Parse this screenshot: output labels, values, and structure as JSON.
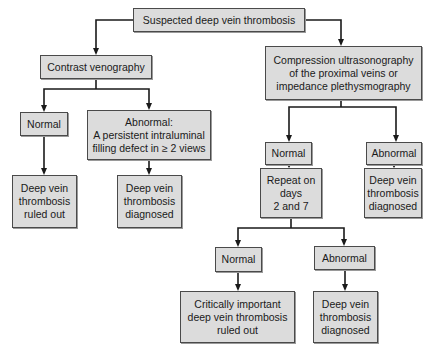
{
  "nodes": {
    "root": "Suspected deep vein thrombosis",
    "venography": "Contrast venography",
    "ultrasound": "Compression ultrasonography\nof the proximal veins or\nimpedance plethysmography",
    "ven_normal": "Normal",
    "ven_abnormal": "Abnormal:\nA persistent intraluminal\nfilling defect in ≥ 2 views",
    "ven_ruled_out": "Deep vein\nthrombosis\nruled out",
    "ven_diagnosed": "Deep vein\nthrombosis\ndiagnosed",
    "us_normal": "Normal",
    "us_abnormal": "Abnormal",
    "repeat": "Repeat on\ndays\n2 and 7",
    "us_diagnosed": "Deep vein\nthrombosis\ndiagnosed",
    "rep_normal": "Normal",
    "rep_abnormal": "Abnormal",
    "rep_ruled_out": "Critically important\ndeep vein thrombosis\nruled out",
    "rep_diagnosed": "Deep vein\nthrombosis\ndiagnosed"
  },
  "colors": {
    "box_fill": "#dcdcdc",
    "box_border": "#4a4a4a",
    "line": "#1a1a1a"
  }
}
